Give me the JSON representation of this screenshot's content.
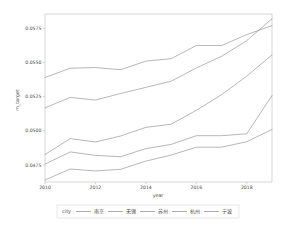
{
  "chart_data": {
    "type": "line",
    "title": "",
    "xlabel": "year",
    "ylabel": "m_target",
    "x": [
      2010,
      2011,
      2012,
      2013,
      2014,
      2015,
      2016,
      2017,
      2018,
      2019
    ],
    "xlim": [
      2010,
      2019
    ],
    "ylim": [
      0.04625,
      0.05855
    ],
    "xticks": [
      2010,
      2012,
      2014,
      2016,
      2018
    ],
    "xticklabels": [
      "2010",
      "2012",
      "2014",
      "2016",
      "2018"
    ],
    "yticks": [
      0.0475,
      0.05,
      0.0525,
      0.055,
      0.0575
    ],
    "yticklabels": [
      "0.0475",
      "0.0500",
      "0.0525",
      "0.0550",
      "0.0575"
    ],
    "grid": false,
    "legend_position": "bottom",
    "legend_title": "city",
    "series": [
      {
        "name": "南京",
        "color": "#8a8a8a",
        "values": [
          0.0539,
          0.05458,
          0.05463,
          0.05447,
          0.0551,
          0.05528,
          0.05624,
          0.05624,
          0.05704,
          0.0577
        ]
      },
      {
        "name": "无锡",
        "color": "#8a8a8a",
        "values": [
          0.05168,
          0.05244,
          0.05225,
          0.05273,
          0.05318,
          0.05363,
          0.0546,
          0.05545,
          0.0566,
          0.0582
        ]
      },
      {
        "name": "苏州",
        "color": "#8a8a8a",
        "values": [
          0.04826,
          0.04943,
          0.04918,
          0.04962,
          0.05025,
          0.05048,
          0.0515,
          0.05264,
          0.054,
          0.05556
        ]
      },
      {
        "name": "杭州",
        "color": "#8a8a8a",
        "values": [
          0.04756,
          0.04845,
          0.0482,
          0.0481,
          0.0487,
          0.049,
          0.04964,
          0.04964,
          0.04978,
          0.05258
        ]
      },
      {
        "name": "宁波",
        "color": "#8a8a8a",
        "values": [
          0.0464,
          0.0472,
          0.04706,
          0.04718,
          0.04778,
          0.04822,
          0.0488,
          0.0488,
          0.0492,
          0.0501
        ]
      }
    ]
  },
  "legend": {
    "title": "city",
    "items": [
      "南京",
      "无锡",
      "苏州",
      "杭州",
      "宁波"
    ]
  },
  "axes": {
    "x_title": "year",
    "y_title": "m_target"
  }
}
